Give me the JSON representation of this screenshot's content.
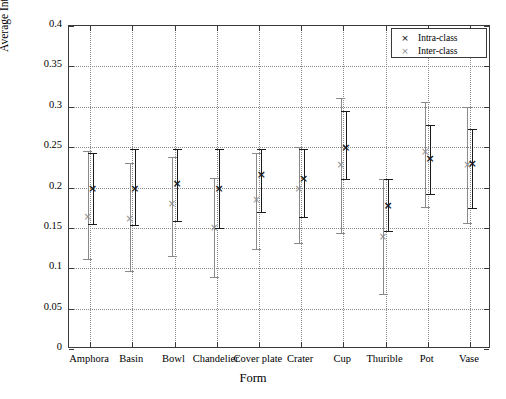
{
  "chart_data": {
    "type": "scatter",
    "title": "",
    "xlabel": "Form",
    "ylabel": "Average Intra- and Inter-class distances",
    "categories": [
      "Amphora",
      "Basin",
      "Bowl",
      "Chandelier",
      "Cover plate",
      "Crater",
      "Cup",
      "Thurible",
      "Pot",
      "Vase"
    ],
    "ylim": [
      0,
      0.4
    ],
    "yticks": [
      "0",
      "0.05",
      "0.1",
      "0.15",
      "0.2",
      "0.25",
      "0.3",
      "0.35",
      "0.4"
    ],
    "ytick_values": [
      0,
      0.05,
      0.1,
      0.15,
      0.2,
      0.25,
      0.3,
      0.35,
      0.4
    ],
    "grid": true,
    "legend_position": "top-right",
    "series": [
      {
        "name": "Intra-class",
        "marker": "×",
        "color": "#1a1a1a",
        "values": [
          0.199,
          0.2,
          0.205,
          0.199,
          0.217,
          0.212,
          0.25,
          0.178,
          0.236,
          0.23
        ],
        "err_low": [
          0.155,
          0.154,
          0.158,
          0.15,
          0.17,
          0.164,
          0.211,
          0.146,
          0.192,
          0.175
        ],
        "err_high": [
          0.243,
          0.248,
          0.248,
          0.248,
          0.248,
          0.248,
          0.295,
          0.211,
          0.278,
          0.272
        ]
      },
      {
        "name": "Inter-class",
        "marker": "×",
        "color": "#8a8a8a",
        "values": [
          0.163,
          0.161,
          0.179,
          0.15,
          0.184,
          0.198,
          0.228,
          0.139,
          0.244,
          0.228
        ],
        "err_low": [
          0.112,
          0.096,
          0.115,
          0.089,
          0.124,
          0.131,
          0.144,
          0.068,
          0.176,
          0.156
        ],
        "err_high": [
          0.245,
          0.23,
          0.238,
          0.212,
          0.243,
          0.25,
          0.311,
          0.21,
          0.306,
          0.3
        ]
      }
    ]
  },
  "legend": {
    "entries": [
      {
        "mark": "×",
        "label": "Intra-class"
      },
      {
        "mark": "×",
        "label": "Inter-class"
      }
    ]
  }
}
